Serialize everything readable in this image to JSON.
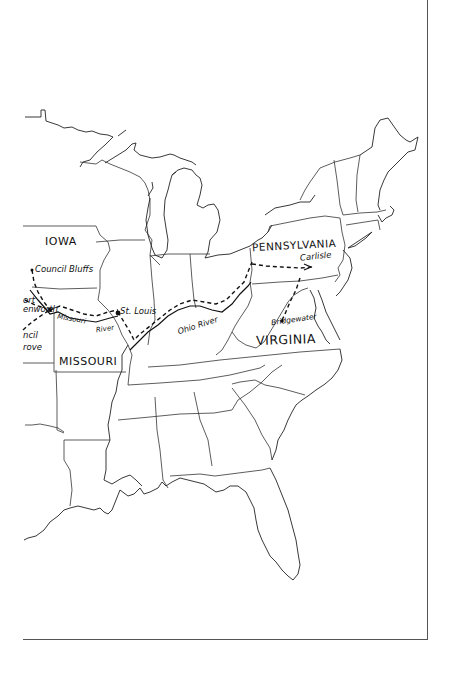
{
  "map": {
    "title": "Hand-drawn map of the eastern United States with route",
    "colors": {
      "background": "#ffffff",
      "ink": "#111111",
      "frame": "#555555"
    },
    "states": [
      {
        "id": "iowa",
        "label": "IOWA"
      },
      {
        "id": "missouri",
        "label": "MISSOURI"
      },
      {
        "id": "pennsylvania",
        "label": "PENNSYLVANIA"
      },
      {
        "id": "virginia",
        "label": "VIRGINIA"
      }
    ],
    "places": [
      {
        "id": "council-bluffs",
        "label": "Council Bluffs"
      },
      {
        "id": "fort-leavenworth",
        "label_line1": "ort",
        "label_line2": "enworth"
      },
      {
        "id": "council-grove",
        "label_line1": "ncil",
        "label_line2": "rove"
      },
      {
        "id": "st-louis",
        "label": "St. Louis"
      },
      {
        "id": "carlisle",
        "label": "Carlisle"
      },
      {
        "id": "bridgewater",
        "label": "Bridgewater"
      }
    ],
    "rivers": [
      {
        "id": "missouri-river",
        "label_line1": "Missouri",
        "label_line2": "River"
      },
      {
        "id": "ohio-river",
        "label": "Ohio River"
      }
    ],
    "route": {
      "style": "dashed",
      "waypoints": [
        "Council Bluffs",
        "Fort Leavenworth",
        "St. Louis",
        "Ohio River",
        "Pennsylvania",
        "Carlisle",
        "Bridgewater"
      ]
    }
  }
}
